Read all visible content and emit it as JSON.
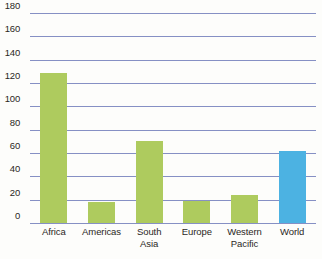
{
  "chart_data": {
    "type": "bar",
    "title": "",
    "subtitle": "",
    "xlabel": "",
    "ylabel": "",
    "categories": [
      "Africa",
      "Americas",
      "South Asia",
      "Europe",
      "Western Pacific",
      "World"
    ],
    "category_lines": [
      [
        "Africa"
      ],
      [
        "Americas"
      ],
      [
        "South",
        "Asia"
      ],
      [
        "Europe"
      ],
      [
        "Western",
        "Pacific"
      ],
      [
        "World"
      ]
    ],
    "values": [
      129,
      18,
      70,
      19,
      24,
      62
    ],
    "bar_colors": [
      "#aecb5e",
      "#aecb5e",
      "#aecb5e",
      "#aecb5e",
      "#aecb5e",
      "#4cb2e2"
    ],
    "ylim": [
      0,
      180
    ],
    "yticks": [
      0,
      20,
      40,
      60,
      80,
      100,
      120,
      140,
      160,
      180
    ],
    "ytick_labels": [
      "0",
      "20",
      "40",
      "60",
      "80",
      "100",
      "120",
      "140",
      "160",
      "180"
    ],
    "grid": true,
    "grid_color": "#8690c4",
    "legend": null,
    "legend_position": "none",
    "annotations": []
  },
  "colors": {
    "background": "#fdfdfb",
    "series_default": "#aecb5e",
    "series_highlight": "#4cb2e2",
    "gridline": "#8690c4",
    "text": "#2b2724"
  }
}
